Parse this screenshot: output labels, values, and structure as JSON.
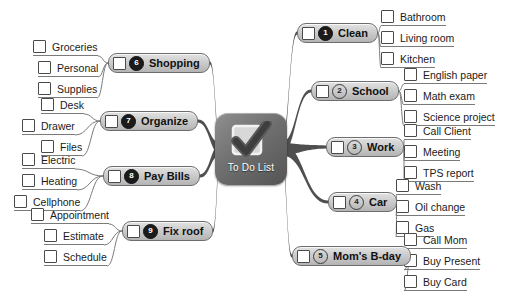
{
  "center": {
    "label": "To Do List",
    "icon": "checkmark-checkbox-icon"
  },
  "branches": [
    {
      "id": "clean",
      "number": "1",
      "label": "Clean",
      "badge_style": "filled",
      "side": "right",
      "pill": {
        "x": 297,
        "y": 23
      },
      "children": [
        {
          "label": "Bathroom",
          "x": 381,
          "y": 9
        },
        {
          "label": "Living room",
          "x": 381,
          "y": 30
        },
        {
          "label": "Kitchen",
          "x": 381,
          "y": 51
        }
      ]
    },
    {
      "id": "school",
      "number": "2",
      "label": "School",
      "badge_style": "outline",
      "side": "right",
      "pill": {
        "x": 311,
        "y": 81
      },
      "children": [
        {
          "label": "English paper",
          "x": 404,
          "y": 67
        },
        {
          "label": "Math exam",
          "x": 404,
          "y": 88
        },
        {
          "label": "Science project",
          "x": 404,
          "y": 109
        }
      ]
    },
    {
      "id": "work",
      "number": "3",
      "label": "Work",
      "badge_style": "outline",
      "side": "right",
      "pill": {
        "x": 326,
        "y": 137
      },
      "children": [
        {
          "label": "Call Client",
          "x": 404,
          "y": 123
        },
        {
          "label": "Meeting",
          "x": 404,
          "y": 144
        },
        {
          "label": "TPS report",
          "x": 404,
          "y": 165
        }
      ]
    },
    {
      "id": "car",
      "number": "4",
      "label": "Car",
      "badge_style": "outline",
      "side": "right",
      "pill": {
        "x": 328,
        "y": 192
      },
      "children": [
        {
          "label": "Wash",
          "x": 396,
          "y": 178
        },
        {
          "label": "Oil change",
          "x": 396,
          "y": 199
        },
        {
          "label": "Gas",
          "x": 396,
          "y": 220
        }
      ]
    },
    {
      "id": "moms-bday",
      "number": "5",
      "label": "Mom's B-day",
      "badge_style": "outline",
      "side": "right",
      "pill": {
        "x": 292,
        "y": 246
      },
      "children": [
        {
          "label": "Call Mom",
          "x": 404,
          "y": 232
        },
        {
          "label": "Buy Present",
          "x": 404,
          "y": 253
        },
        {
          "label": "Buy Card",
          "x": 404,
          "y": 274
        }
      ]
    },
    {
      "id": "shopping",
      "number": "6",
      "label": "Shopping",
      "badge_style": "filled",
      "side": "left",
      "pill": {
        "x": 108,
        "y": 53
      },
      "children": [
        {
          "label": "Groceries",
          "x": 33,
          "y": 39
        },
        {
          "label": "Personal",
          "x": 38,
          "y": 60
        },
        {
          "label": "Supplies",
          "x": 38,
          "y": 81
        }
      ]
    },
    {
      "id": "organize",
      "number": "7",
      "label": "Organize",
      "badge_style": "filled",
      "side": "left",
      "pill": {
        "x": 100,
        "y": 111
      },
      "children": [
        {
          "label": "Desk",
          "x": 41,
          "y": 97
        },
        {
          "label": "Drawer",
          "x": 22,
          "y": 118
        },
        {
          "label": "Files",
          "x": 41,
          "y": 139
        }
      ]
    },
    {
      "id": "pay-bills",
      "number": "8",
      "label": "Pay Bills",
      "badge_style": "filled",
      "side": "left",
      "pill": {
        "x": 103,
        "y": 166
      },
      "children": [
        {
          "label": "Electric",
          "x": 22,
          "y": 152
        },
        {
          "label": "Heating",
          "x": 22,
          "y": 173
        },
        {
          "label": "Cellphone",
          "x": 14,
          "y": 194
        }
      ]
    },
    {
      "id": "fix-roof",
      "number": "9",
      "label": "Fix roof",
      "badge_style": "filled",
      "side": "left",
      "pill": {
        "x": 122,
        "y": 221
      },
      "children": [
        {
          "label": "Appointment",
          "x": 31,
          "y": 207
        },
        {
          "label": "Estimate",
          "x": 44,
          "y": 228
        },
        {
          "label": "Schedule",
          "x": 44,
          "y": 249
        }
      ]
    }
  ]
}
